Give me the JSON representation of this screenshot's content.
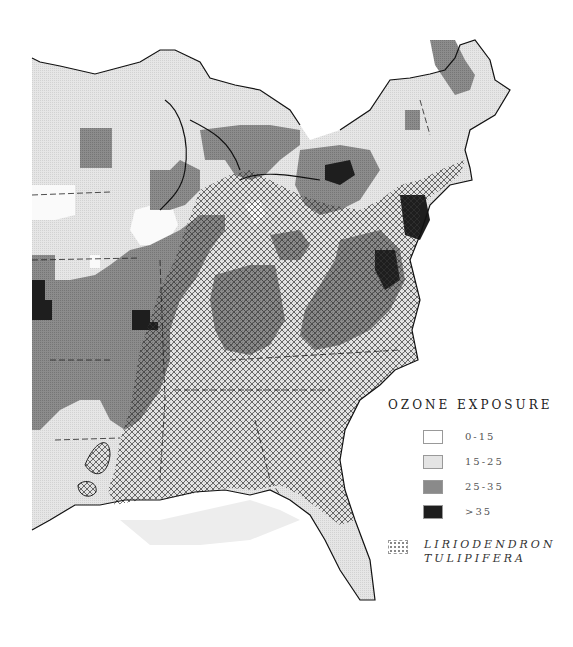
{
  "legend": {
    "title": "OZONE EXPOSURE",
    "classes": [
      {
        "label": "0-15",
        "color": "#ffffff"
      },
      {
        "label": "15-25",
        "color": "#e4e4e4"
      },
      {
        "label": "25-35",
        "color": "#8a8a8a"
      },
      {
        "label": ">35",
        "color": "#1e1e1e"
      }
    ],
    "species": {
      "line1": "LIRIODENDRON",
      "line2": "TULIPIFERA",
      "pattern": "crosshatch"
    }
  },
  "map": {
    "region": "Eastern United States",
    "colors": {
      "low": "#ffffff",
      "light": "#e4e4e4",
      "medium": "#8a8a8a",
      "high": "#1e1e1e",
      "outline": "#111111"
    }
  }
}
